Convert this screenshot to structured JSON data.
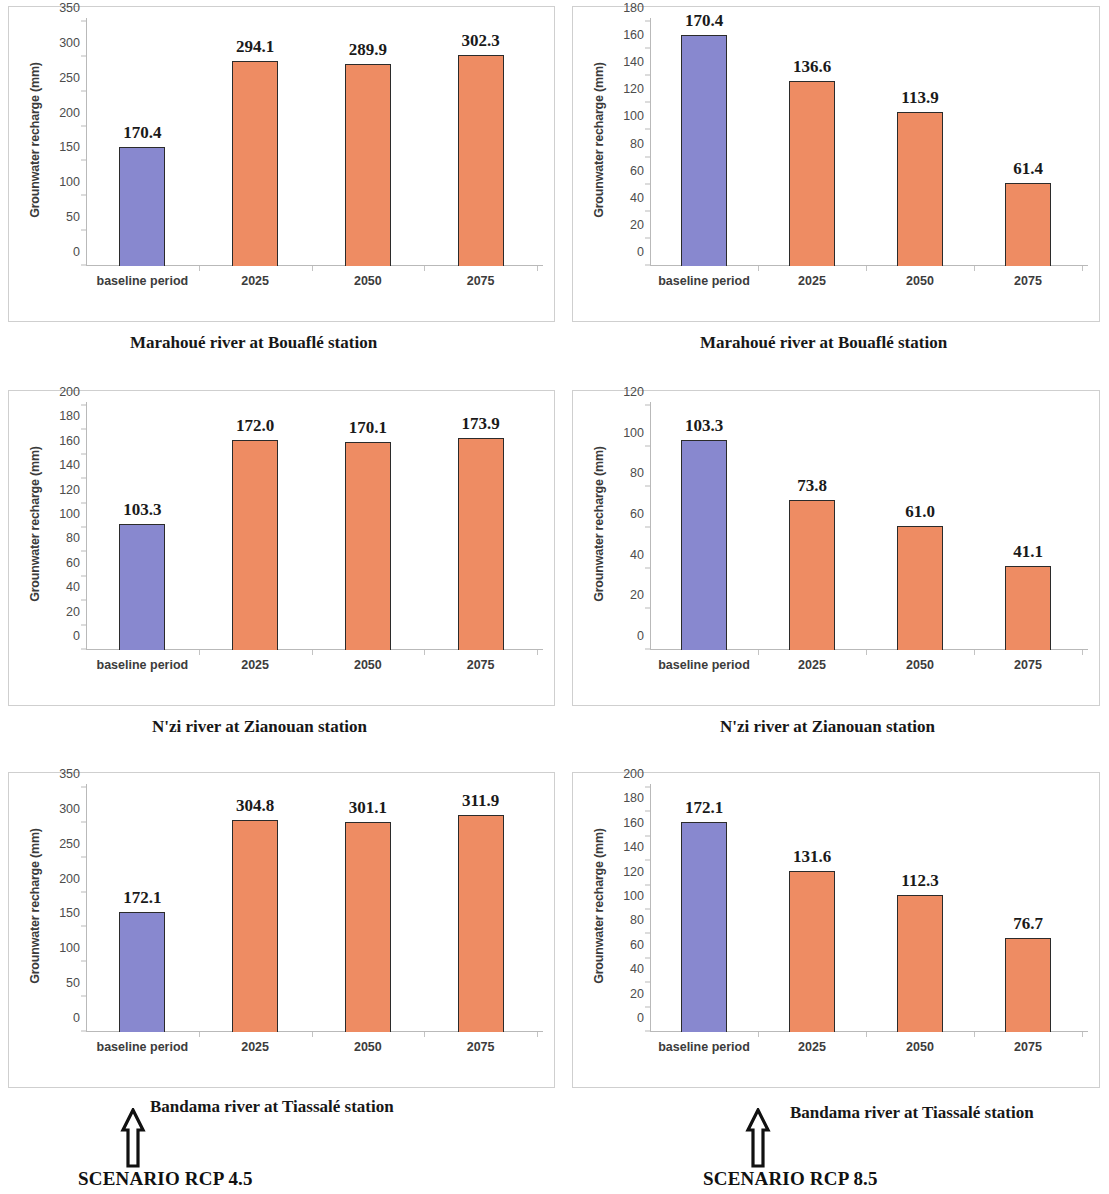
{
  "figure": {
    "ylabel": "Grounwater recharge (mm)",
    "categories": [
      "baseline period",
      "2025",
      "2050",
      "2075"
    ],
    "colors": {
      "baseline": "#8888cf",
      "scenario": "#ee8c63",
      "bar_outline": "#2b2b2b",
      "axis": "#b9b9b9"
    }
  },
  "left_column": {
    "scenario_label": "SCENARIO RCP 4.5",
    "arrow_icon": "up-arrow-icon"
  },
  "right_column": {
    "scenario_label": "SCENARIO RCP 8.5",
    "arrow_icon": "up-arrow-icon"
  },
  "captions": {
    "r1c1": "Marahoué river at Bouaflé station",
    "r1c2": "Marahoué river at Bouaflé station",
    "r2c1": "N'zi river at Zianouan station",
    "r2c2": "N'zi river at Zianouan station",
    "r3c1": "Bandama river at Tiassalé station",
    "r3c2": "Bandama river at Tiassalé station"
  },
  "chart_data": [
    {
      "id": "marahoue-rcp45",
      "type": "bar",
      "title": "Marahoué river at Bouaflé station",
      "scenario": "SCENARIO RCP 4.5",
      "xlabel": "",
      "ylabel": "Grounwater recharge (mm)",
      "categories": [
        "baseline period",
        "2025",
        "2050",
        "2075"
      ],
      "values": [
        170.4,
        294.1,
        289.9,
        302.3
      ],
      "labels": [
        "170.4",
        "294.1",
        "289.9",
        "302.3"
      ],
      "ylim": [
        0,
        350
      ],
      "yticks": [
        0,
        50,
        100,
        150,
        200,
        250,
        300,
        350
      ],
      "ytick_labels": [
        "0",
        "50",
        "100",
        "150",
        "200",
        "250",
        "300",
        "350"
      ],
      "grid": false,
      "legend": "none",
      "bar_colors": [
        "#8888cf",
        "#ee8c63",
        "#ee8c63",
        "#ee8c63"
      ]
    },
    {
      "id": "marahoue-rcp85",
      "type": "bar",
      "title": "Marahoué river at Bouaflé station",
      "scenario": "SCENARIO RCP 8.5",
      "xlabel": "",
      "ylabel": "Grounwater recharge (mm)",
      "categories": [
        "baseline period",
        "2025",
        "2050",
        "2075"
      ],
      "values": [
        170.4,
        136.6,
        113.9,
        61.4
      ],
      "labels": [
        "170.4",
        "136.6",
        "113.9",
        "61.4"
      ],
      "ylim": [
        0,
        180
      ],
      "yticks": [
        0,
        20,
        40,
        60,
        80,
        100,
        120,
        140,
        160,
        180
      ],
      "ytick_labels": [
        "0",
        "20",
        "40",
        "60",
        "80",
        "100",
        "120",
        "140",
        "160",
        "180"
      ],
      "grid": false,
      "legend": "none",
      "bar_colors": [
        "#8888cf",
        "#ee8c63",
        "#ee8c63",
        "#ee8c63"
      ]
    },
    {
      "id": "nzi-rcp45",
      "type": "bar",
      "title": "N'zi river at Zianouan station",
      "scenario": "SCENARIO RCP 4.5",
      "xlabel": "",
      "ylabel": "Grounwater recharge (mm)",
      "categories": [
        "baseline period",
        "2025",
        "2050",
        "2075"
      ],
      "values": [
        103.3,
        172.0,
        170.1,
        173.9
      ],
      "labels": [
        "103.3",
        "172.0",
        "170.1",
        "173.9"
      ],
      "ylim": [
        0,
        200
      ],
      "yticks": [
        0,
        20,
        40,
        60,
        80,
        100,
        120,
        140,
        160,
        180,
        200
      ],
      "ytick_labels": [
        "0",
        "20",
        "40",
        "60",
        "80",
        "100",
        "120",
        "140",
        "160",
        "180",
        "200"
      ],
      "grid": false,
      "legend": "none",
      "bar_colors": [
        "#8888cf",
        "#ee8c63",
        "#ee8c63",
        "#ee8c63"
      ]
    },
    {
      "id": "nzi-rcp85",
      "type": "bar",
      "title": "N'zi river at Zianouan station",
      "scenario": "SCENARIO RCP 8.5",
      "xlabel": "",
      "ylabel": "Grounwater recharge (mm)",
      "categories": [
        "baseline period",
        "2025",
        "2050",
        "2075"
      ],
      "values": [
        103.3,
        73.8,
        61.0,
        41.1
      ],
      "labels": [
        "103.3",
        "73.8",
        "61.0",
        "41.1"
      ],
      "ylim": [
        0,
        120
      ],
      "yticks": [
        0,
        20,
        40,
        60,
        80,
        100,
        120
      ],
      "ytick_labels": [
        "0",
        "20",
        "40",
        "60",
        "80",
        "100",
        "120"
      ],
      "grid": false,
      "legend": "none",
      "bar_colors": [
        "#8888cf",
        "#ee8c63",
        "#ee8c63",
        "#ee8c63"
      ]
    },
    {
      "id": "bandama-rcp45",
      "type": "bar",
      "title": "Bandama river at Tiassalé station",
      "scenario": "SCENARIO RCP 4.5",
      "xlabel": "",
      "ylabel": "Grounwater recharge (mm)",
      "categories": [
        "baseline period",
        "2025",
        "2050",
        "2075"
      ],
      "values": [
        172.1,
        304.8,
        301.1,
        311.9
      ],
      "labels": [
        "172.1",
        "304.8",
        "301.1",
        "311.9"
      ],
      "ylim": [
        0,
        350
      ],
      "yticks": [
        0,
        50,
        100,
        150,
        200,
        250,
        300,
        350
      ],
      "ytick_labels": [
        "0",
        "50",
        "100",
        "150",
        "200",
        "250",
        "300",
        "350"
      ],
      "grid": false,
      "legend": "none",
      "bar_colors": [
        "#8888cf",
        "#ee8c63",
        "#ee8c63",
        "#ee8c63"
      ]
    },
    {
      "id": "bandama-rcp85",
      "type": "bar",
      "title": "Bandama river at Tiassalé station",
      "scenario": "SCENARIO RCP 8.5",
      "xlabel": "",
      "ylabel": "Grounwater recharge (mm)",
      "categories": [
        "baseline period",
        "2025",
        "2050",
        "2075"
      ],
      "values": [
        172.1,
        131.6,
        112.3,
        76.7
      ],
      "labels": [
        "172.1",
        "131.6",
        "112.3",
        "76.7"
      ],
      "ylim": [
        0,
        200
      ],
      "yticks": [
        0,
        20,
        40,
        60,
        80,
        100,
        120,
        140,
        160,
        180,
        200
      ],
      "ytick_labels": [
        "0",
        "20",
        "40",
        "60",
        "80",
        "100",
        "120",
        "140",
        "160",
        "180",
        "200"
      ],
      "grid": false,
      "legend": "none",
      "bar_colors": [
        "#8888cf",
        "#ee8c63",
        "#ee8c63",
        "#ee8c63"
      ]
    }
  ]
}
